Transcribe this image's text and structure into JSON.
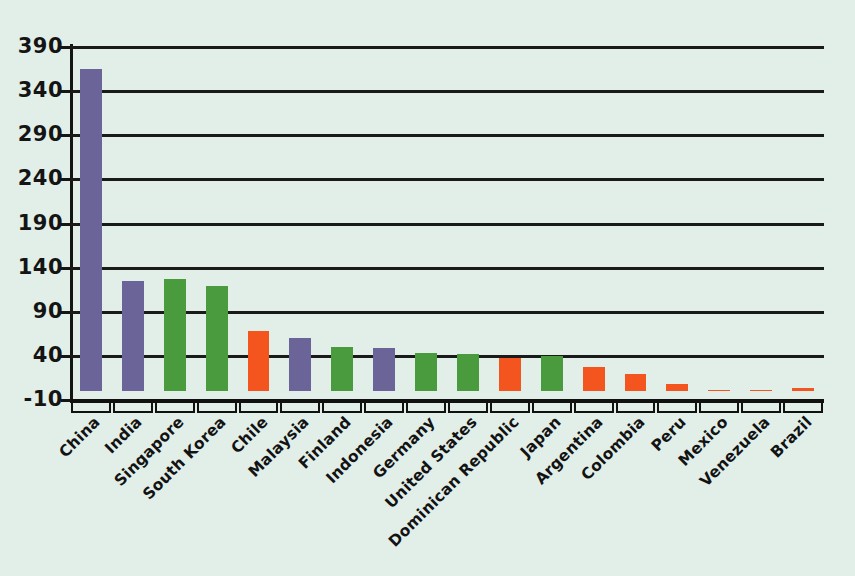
{
  "chart_data": {
    "type": "bar",
    "title": "",
    "subtitle": "",
    "xlabel": "",
    "ylabel": "",
    "grid": true,
    "legend": "none",
    "ylim": [
      -10,
      390
    ],
    "ytick_labels": [
      "390",
      "340",
      "290",
      "240",
      "190",
      "140",
      "90",
      "40",
      "-10"
    ],
    "yticks": [
      390,
      340,
      290,
      240,
      190,
      140,
      90,
      40,
      -10
    ],
    "categories": [
      "China",
      "India",
      "Singapore",
      "South Korea",
      "Chile",
      "Malaysia",
      "Finland",
      "Indonesia",
      "Germany",
      "United States",
      "Dominican Republic",
      "Japan",
      "Argentina",
      "Colombia",
      "Peru",
      "Mexico",
      "Venezuela",
      "Brazil"
    ],
    "values": [
      365,
      125,
      127,
      119,
      68,
      60,
      50,
      49,
      43,
      42,
      38,
      40,
      27,
      19,
      8,
      1,
      1,
      4
    ],
    "bar_colors": [
      "#6a6499",
      "#6a6499",
      "#4a9b3d",
      "#4a9b3d",
      "#f4551f",
      "#6a6499",
      "#4a9b3d",
      "#6a6499",
      "#4a9b3d",
      "#4a9b3d",
      "#f4551f",
      "#4a9b3d",
      "#f4551f",
      "#f4551f",
      "#f4551f",
      "#f4551f",
      "#f4551f",
      "#f4551f"
    ]
  },
  "colors": {
    "background": "#e2efe9",
    "axis": "#151515",
    "gridline": "#1a1a1a",
    "purple": "#6a6499",
    "green": "#4a9b3d",
    "orange": "#f4551f"
  }
}
